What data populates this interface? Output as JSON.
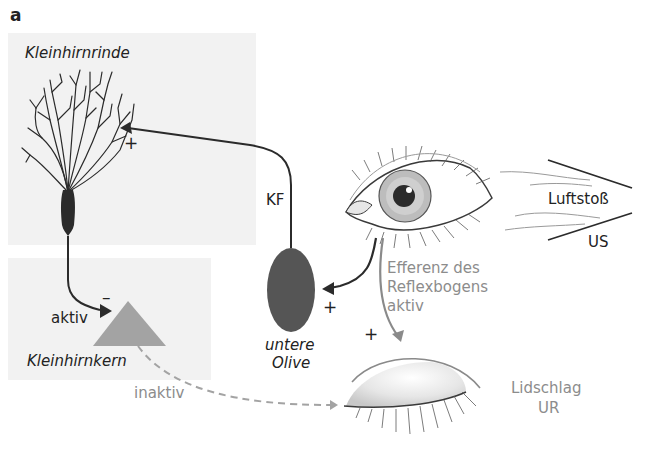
{
  "panel_label": "a",
  "regions": {
    "cortex": {
      "label": "Kleinhirnrinde"
    },
    "nucleus": {
      "label": "Kleinhirnkern"
    },
    "olive": {
      "label_line1": "untere",
      "label_line2": "Olive"
    }
  },
  "pathways": {
    "climbing_fiber": {
      "label": "KF",
      "sign": "+"
    },
    "purkinje_to_nucleus": {
      "label": "aktiv",
      "sign": "–"
    },
    "nucleus_to_eyelid": {
      "label": "inaktiv"
    },
    "eye_to_olive": {
      "sign": "+"
    },
    "reflex_efferent": {
      "line1": "Efferenz des",
      "line2": "Reflexbogens",
      "line3": "aktiv",
      "sign": "+"
    }
  },
  "stimulus": {
    "label": "Luftstoß",
    "abbr": "US"
  },
  "response": {
    "label": "Lidschlag",
    "abbr": "UR"
  },
  "colors": {
    "panel_bg": "#f2f2f2",
    "neuron": "#2b2b2b",
    "olive": "#555555",
    "nucleus": "#a3a3a3",
    "grey_text": "#8c8c8c",
    "reflex_arrow": "#8a8a8a"
  }
}
